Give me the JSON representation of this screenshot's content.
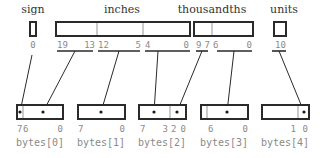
{
  "fields": [
    {
      "id": "sign",
      "label": "sign",
      "bits": [
        "0"
      ]
    },
    {
      "id": "inches",
      "label": "inches",
      "bits": [
        "19",
        "13",
        "12",
        "5",
        "4",
        "0"
      ]
    },
    {
      "id": "thousandths",
      "label": "thousandths",
      "bits": [
        "9",
        "7",
        "6",
        "0"
      ]
    },
    {
      "id": "units",
      "label": "units",
      "bits": [
        "1",
        "0"
      ]
    }
  ],
  "bytes": [
    {
      "label": "bytes[0]",
      "bits": [
        "7",
        "6",
        "0"
      ]
    },
    {
      "label": "bytes[1]",
      "bits": [
        "7",
        "0"
      ]
    },
    {
      "label": "bytes[2]",
      "bits": [
        "7",
        "3",
        "2",
        "0"
      ]
    },
    {
      "label": "bytes[3]",
      "bits": [
        "6",
        "0"
      ]
    },
    {
      "label": "bytes[4]",
      "bits": [
        "1",
        "0"
      ]
    }
  ],
  "colors": {
    "stroke": "#2a2a2a",
    "divider": "#a8a8a8",
    "bit_label": "#8a8a8a",
    "field_label": "#333333"
  }
}
